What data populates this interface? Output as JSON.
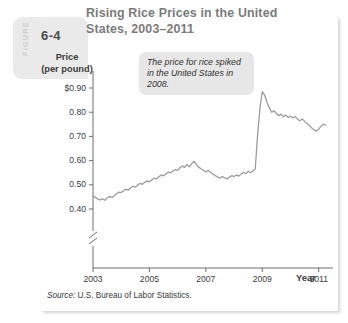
{
  "figure": {
    "badge_word": "FIGURE",
    "badge_number": "6-4",
    "title": "Rising Rice Prices in the United States, 2003–2011",
    "source": "U.S. Bureau of Labor Statistics.",
    "source_word": "Source:"
  },
  "annotation": {
    "text": "The price for rice spiked in the United States in 2008."
  },
  "colors": {
    "line": "#9a9a9a",
    "axis": "#6e6e6e",
    "title": "#7b7b7b",
    "badge_bg": "#ebeaea",
    "callout_bg": "#e8e7e7",
    "text": "#3d3d3d"
  },
  "chart_data": {
    "type": "line",
    "title": "Rising Rice Prices in the United States, 2003–2011",
    "xlabel": "Year",
    "ylabel": "Price (per pound)",
    "xlim": [
      2003,
      2011.4
    ],
    "ylim": [
      0.355,
      0.935
    ],
    "grid": false,
    "legend": null,
    "axis_break_y": true,
    "ytick_labels": [
      "$0.90",
      "0.80",
      "0.70",
      "0.60",
      "0.50",
      "0.40"
    ],
    "yticks": [
      0.9,
      0.8,
      0.7,
      0.6,
      0.5,
      0.4
    ],
    "xtick_labels": [
      "2003",
      "2005",
      "2007",
      "2009",
      "2011"
    ],
    "xticks": [
      2003,
      2005,
      2007,
      2009,
      2011
    ],
    "annotations": [
      {
        "text": "The price for rice spiked in the United States in 2008.",
        "points_to": {
          "x": 2008.55,
          "y": 0.885
        }
      }
    ],
    "series": [
      {
        "name": "Rice price (per pound)",
        "x": [
          2003.0,
          2003.08,
          2003.17,
          2003.25,
          2003.33,
          2003.42,
          2003.5,
          2003.58,
          2003.67,
          2003.75,
          2003.83,
          2003.92,
          2004.0,
          2004.08,
          2004.17,
          2004.25,
          2004.33,
          2004.42,
          2004.5,
          2004.58,
          2004.67,
          2004.75,
          2004.83,
          2004.92,
          2005.0,
          2005.08,
          2005.17,
          2005.25,
          2005.33,
          2005.42,
          2005.5,
          2005.58,
          2005.67,
          2005.75,
          2005.83,
          2005.92,
          2006.0,
          2006.08,
          2006.17,
          2006.25,
          2006.33,
          2006.42,
          2006.5,
          2006.58,
          2006.67,
          2006.75,
          2006.83,
          2006.92,
          2007.0,
          2007.08,
          2007.17,
          2007.25,
          2007.33,
          2007.42,
          2007.5,
          2007.58,
          2007.67,
          2007.75,
          2007.83,
          2007.92,
          2008.0,
          2008.08,
          2008.17,
          2008.25,
          2008.33,
          2008.42,
          2008.5,
          2008.58,
          2008.67,
          2008.75,
          2008.83,
          2008.92,
          2009.0,
          2009.08,
          2009.17,
          2009.25,
          2009.33,
          2009.42,
          2009.5,
          2009.58,
          2009.67,
          2009.75,
          2009.83,
          2009.92,
          2010.0,
          2010.08,
          2010.17,
          2010.25,
          2010.33,
          2010.42,
          2010.5,
          2010.58,
          2010.67,
          2010.75,
          2010.83,
          2010.92,
          2011.0,
          2011.08,
          2011.17,
          2011.25
        ],
        "y": [
          0.455,
          0.448,
          0.441,
          0.437,
          0.442,
          0.436,
          0.445,
          0.452,
          0.448,
          0.455,
          0.463,
          0.47,
          0.468,
          0.475,
          0.482,
          0.478,
          0.487,
          0.494,
          0.49,
          0.498,
          0.506,
          0.502,
          0.51,
          0.516,
          0.512,
          0.52,
          0.528,
          0.524,
          0.533,
          0.541,
          0.537,
          0.545,
          0.553,
          0.549,
          0.557,
          0.563,
          0.56,
          0.57,
          0.578,
          0.572,
          0.583,
          0.575,
          0.588,
          0.597,
          0.583,
          0.572,
          0.566,
          0.559,
          0.553,
          0.56,
          0.551,
          0.545,
          0.538,
          0.532,
          0.527,
          0.534,
          0.529,
          0.524,
          0.531,
          0.538,
          0.534,
          0.541,
          0.536,
          0.545,
          0.552,
          0.546,
          0.556,
          0.55,
          0.558,
          0.565,
          0.7,
          0.82,
          0.885,
          0.872,
          0.84,
          0.818,
          0.8,
          0.806,
          0.794,
          0.786,
          0.792,
          0.781,
          0.788,
          0.778,
          0.784,
          0.776,
          0.782,
          0.771,
          0.765,
          0.772,
          0.762,
          0.754,
          0.745,
          0.735,
          0.727,
          0.722,
          0.73,
          0.742,
          0.75,
          0.746
        ]
      }
    ]
  }
}
